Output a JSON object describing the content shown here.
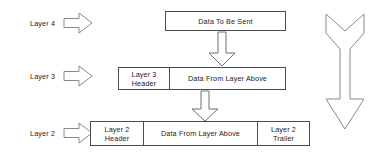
{
  "diagram": {
    "background_color": "#ffffff",
    "line_color": "#4c4c4c",
    "text_color": "#1b1b1b"
  },
  "layers": [
    {
      "label": "Layer 4",
      "arrow_icon": "right-block-arrow-icon"
    },
    {
      "label": "Layer 3",
      "arrow_icon": "right-block-arrow-icon"
    },
    {
      "label": "Layer 2",
      "arrow_icon": "right-block-arrow-icon"
    }
  ],
  "rows": [
    {
      "id": "layer-4-pdu",
      "cells": [
        {
          "text": "Data To Be Sent",
          "role": "payload"
        }
      ]
    },
    {
      "id": "layer-3-pdu",
      "cells": [
        {
          "text": "Layer 3 Header",
          "role": "header"
        },
        {
          "text": "Data From Layer Above",
          "role": "payload"
        }
      ]
    },
    {
      "id": "layer-2-pdu",
      "cells": [
        {
          "text": "Layer 2 Header",
          "role": "header"
        },
        {
          "text": "Data From Layer Above",
          "role": "payload"
        },
        {
          "text": "Layer 2 Trailer",
          "role": "trailer"
        }
      ]
    }
  ],
  "connectors": [
    {
      "id": "connector-l4-to-l3",
      "icon": "down-block-arrow-icon"
    },
    {
      "id": "connector-l3-to-l2",
      "icon": "down-block-arrow-icon"
    }
  ],
  "flow_arrow": {
    "id": "encapsulation-flow-arrow",
    "icon": "long-down-arrow-icon",
    "direction": "down"
  }
}
